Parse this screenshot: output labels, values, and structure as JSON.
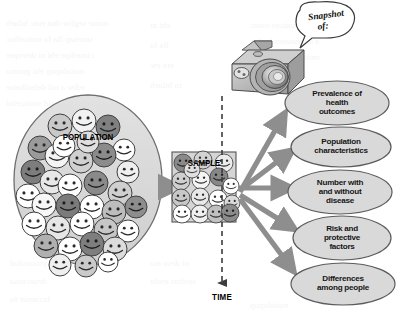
{
  "figure": {
    "type": "cross-sectional-study-diagram",
    "background_color": "#ffffff"
  },
  "population": {
    "label": "POPULATION",
    "shape": "ellipse",
    "fill_color": "#d8d8d8",
    "stroke_color": "#6e6e6e",
    "cx": 88,
    "cy": 180,
    "rx": 74,
    "ry": 85,
    "face_count": 34,
    "face_shades": [
      "#ffffff",
      "#e2e2e2",
      "#b9b9b9",
      "#8f8f8f",
      "#6f6f6f"
    ],
    "faces": [
      {
        "x": 60,
        "y": 126,
        "r": 12,
        "shade": "#c9c9c9"
      },
      {
        "x": 84,
        "y": 121,
        "r": 12,
        "shade": "#f2f2f2"
      },
      {
        "x": 108,
        "y": 127,
        "r": 12,
        "shade": "#808080"
      },
      {
        "x": 40,
        "y": 148,
        "r": 12,
        "shade": "#9a9a9a"
      },
      {
        "x": 124,
        "y": 150,
        "r": 11,
        "shade": "#ffffff"
      },
      {
        "x": 33,
        "y": 172,
        "r": 12,
        "shade": "#7d7d7d"
      },
      {
        "x": 57,
        "y": 156,
        "r": 12,
        "shade": "#f4f4f4"
      },
      {
        "x": 81,
        "y": 161,
        "r": 12,
        "shade": "#d0d0d0"
      },
      {
        "x": 104,
        "y": 155,
        "r": 12,
        "shade": "#8b8b8b"
      },
      {
        "x": 128,
        "y": 172,
        "r": 11,
        "shade": "#efefef"
      },
      {
        "x": 28,
        "y": 196,
        "r": 12,
        "shade": "#ffffff"
      },
      {
        "x": 52,
        "y": 182,
        "r": 12,
        "shade": "#e8e8e8"
      },
      {
        "x": 70,
        "y": 186,
        "r": 12,
        "shade": "#ffffff"
      },
      {
        "x": 96,
        "y": 183,
        "r": 12,
        "shade": "#8a8a8a"
      },
      {
        "x": 120,
        "y": 193,
        "r": 12,
        "shade": "#cfcfcf"
      },
      {
        "x": 44,
        "y": 205,
        "r": 12,
        "shade": "#f7f7f7"
      },
      {
        "x": 68,
        "y": 206,
        "r": 12,
        "shade": "#7b7b7b"
      },
      {
        "x": 92,
        "y": 207,
        "r": 12,
        "shade": "#ffffff"
      },
      {
        "x": 114,
        "y": 212,
        "r": 12,
        "shade": "#bdbdbd"
      },
      {
        "x": 136,
        "y": 207,
        "r": 11,
        "shade": "#8d8d8d"
      },
      {
        "x": 34,
        "y": 224,
        "r": 12,
        "shade": "#ffffff"
      },
      {
        "x": 58,
        "y": 228,
        "r": 12,
        "shade": "#e6e6e6"
      },
      {
        "x": 82,
        "y": 224,
        "r": 12,
        "shade": "#ffffff"
      },
      {
        "x": 106,
        "y": 230,
        "r": 12,
        "shade": "#c6c6c6"
      },
      {
        "x": 128,
        "y": 231,
        "r": 11,
        "shade": "#ffffff"
      },
      {
        "x": 46,
        "y": 246,
        "r": 12,
        "shade": "#b0b0b0"
      },
      {
        "x": 70,
        "y": 249,
        "r": 12,
        "shade": "#ffffff"
      },
      {
        "x": 92,
        "y": 244,
        "r": 12,
        "shade": "#7e7e7e"
      },
      {
        "x": 115,
        "y": 249,
        "r": 12,
        "shade": "#dcdcdc"
      },
      {
        "x": 64,
        "y": 146,
        "r": 11,
        "shade": "#ffffff"
      },
      {
        "x": 88,
        "y": 142,
        "r": 11,
        "shade": "#dfdfdf"
      },
      {
        "x": 60,
        "y": 265,
        "r": 11,
        "shade": "#efefef"
      },
      {
        "x": 86,
        "y": 266,
        "r": 11,
        "shade": "#cacaca"
      },
      {
        "x": 108,
        "y": 262,
        "r": 10,
        "shade": "#ffffff"
      }
    ]
  },
  "sample": {
    "label": "SAMPLE",
    "shape": "rectangle",
    "fill_color": "#d5d5d5",
    "stroke_color": "#555555",
    "x": 172,
    "y": 152,
    "width": 64,
    "height": 70,
    "face_count": 16,
    "faces": [
      {
        "x": 183,
        "y": 163,
        "r": 9,
        "shade": "#8a8a8a"
      },
      {
        "x": 203,
        "y": 160,
        "r": 9,
        "shade": "#d2d2d2"
      },
      {
        "x": 224,
        "y": 163,
        "r": 9,
        "shade": "#ececec"
      },
      {
        "x": 181,
        "y": 181,
        "r": 9,
        "shade": "#cfcfcf"
      },
      {
        "x": 201,
        "y": 180,
        "r": 9,
        "shade": "#f4f4f4"
      },
      {
        "x": 219,
        "y": 177,
        "r": 9,
        "shade": "#878787"
      },
      {
        "x": 231,
        "y": 186,
        "r": 8,
        "shade": "#ffffff"
      },
      {
        "x": 181,
        "y": 198,
        "r": 9,
        "shade": "#c7c7c7"
      },
      {
        "x": 200,
        "y": 197,
        "r": 9,
        "shade": "#e8e8e8"
      },
      {
        "x": 218,
        "y": 199,
        "r": 9,
        "shade": "#ffffff"
      },
      {
        "x": 232,
        "y": 203,
        "r": 8,
        "shade": "#dadada"
      },
      {
        "x": 182,
        "y": 214,
        "r": 9,
        "shade": "#ffffff"
      },
      {
        "x": 200,
        "y": 214,
        "r": 9,
        "shade": "#f0f0f0"
      },
      {
        "x": 216,
        "y": 214,
        "r": 9,
        "shade": "#c0c0c0"
      },
      {
        "x": 230,
        "y": 213,
        "r": 9,
        "shade": "#8b8b8b"
      },
      {
        "x": 192,
        "y": 170,
        "r": 8,
        "shade": "#e0e0e0"
      }
    ]
  },
  "camera": {
    "name": "camera",
    "body_color": "#b8b8b8",
    "lens_color": "#9a9a9a",
    "outline_color": "#4a4a4a",
    "x": 230,
    "y": 36,
    "width": 78,
    "height": 62
  },
  "speech_bubble": {
    "text_line1": "Snapshot",
    "text_line2": "of:",
    "fill_color": "#ffffff",
    "stroke_color": "#3a3a3a",
    "cx": 322,
    "cy": 26,
    "rx": 32,
    "ry": 19
  },
  "time_axis": {
    "label": "TIME",
    "style": "dashed",
    "color": "#3c3c3c",
    "x": 222,
    "y_start": 96,
    "y_end": 287,
    "arrow": "down"
  },
  "flow_arrow": {
    "name": "population-to-sample-arrow",
    "color": "#8e8e8e",
    "from_x": 160,
    "to_x": 171,
    "y": 187
  },
  "fan_arrows": {
    "color": "#8e8e8e",
    "origin_x": 238,
    "origin_y": 187,
    "count": 5
  },
  "outcomes": {
    "fill_color": "#d9d9d9",
    "stroke_color": "#5b5b5b",
    "items": [
      {
        "id": "prevalence-of-health-outcomes",
        "lines": [
          "Prevalence of",
          "health",
          "outcomes"
        ],
        "cx": 337,
        "cy": 103,
        "rx": 52,
        "ry": 22
      },
      {
        "id": "population-characteristics",
        "lines": [
          "Population",
          "characteristics"
        ],
        "cx": 341,
        "cy": 147,
        "rx": 50,
        "ry": 20
      },
      {
        "id": "number-with-and-without-disease",
        "lines": [
          "Number with",
          "and without",
          "disease"
        ],
        "cx": 340,
        "cy": 192,
        "rx": 52,
        "ry": 22
      },
      {
        "id": "risk-and-protective-factors",
        "lines": [
          "Risk and",
          "protective",
          "factors"
        ],
        "cx": 342,
        "cy": 238,
        "rx": 49,
        "ry": 22
      },
      {
        "id": "differences-among-people",
        "lines": [
          "Differences",
          "among people"
        ],
        "cx": 343,
        "cy": 284,
        "rx": 52,
        "ry": 21
      }
    ]
  },
  "background_bleed": {
    "note": "faint mirrored show-through text from reverse page",
    "lines": [
      {
        "x": 6,
        "y": 18,
        "text": "nonte segliw dna erac htlaeh"
      },
      {
        "x": 6,
        "y": 34,
        "text": "stneitap lla fo noitcelloc"
      },
      {
        "x": 6,
        "y": 50,
        "text": "cimedipe eht ni detroper"
      },
      {
        "x": 6,
        "y": 66,
        "text": "noitalupop eht gnoma"
      },
      {
        "x": 6,
        "y": 82,
        "text": "ediw a rof dehsilbatse"
      },
      {
        "x": 6,
        "y": 98,
        "text": "sesaesid suoitcefni"
      },
      {
        "x": 250,
        "y": 20,
        "text": "seiduts lanoitces-ssorc"
      },
      {
        "x": 250,
        "y": 36,
        "text": "a ta erusaem hcihw"
      },
      {
        "x": 250,
        "y": 52,
        "text": "emit ni tniop elgnis"
      },
      {
        "x": 250,
        "y": 68,
        "text": "ecnelaverp dna"
      },
      {
        "x": 150,
        "y": 20,
        "text": "eht ni"
      },
      {
        "x": 150,
        "y": 40,
        "text": "lla fo"
      },
      {
        "x": 150,
        "y": 60,
        "text": "era ew"
      },
      {
        "x": 150,
        "y": 80,
        "text": "ro htlaeh"
      },
      {
        "x": 10,
        "y": 258,
        "text": "yrotarobal"
      },
      {
        "x": 10,
        "y": 276,
        "text": "detaicossa"
      },
      {
        "x": 10,
        "y": 294,
        "text": "hcraeser fo"
      },
      {
        "x": 150,
        "y": 258,
        "text": "ni desu era"
      },
      {
        "x": 150,
        "y": 276,
        "text": "seiduts eseht"
      },
      {
        "x": 250,
        "y": 300,
        "text": "noitalupop"
      }
    ]
  }
}
